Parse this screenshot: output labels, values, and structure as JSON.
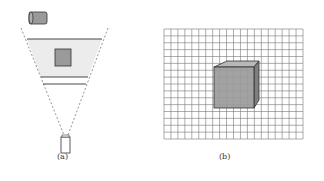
{
  "panels": [
    {
      "id": "a",
      "caption": "(a)",
      "description": "Top-down view: tilted projector/camera above, a shaded viewing frustum containing a square object between two horizontal planes, and a camera at the bottom apex",
      "elements": [
        "projector-top",
        "frustum-shaded-region",
        "object-square",
        "near-plane-lines",
        "camera-bottom",
        "dashed-frustum-edges"
      ]
    },
    {
      "id": "b",
      "caption": "(b)",
      "description": "Cube shown in perspective against a uniform square grid background",
      "grid": {
        "columns": 20,
        "rows": 16
      },
      "elements": [
        "grid-background",
        "cube"
      ]
    }
  ],
  "colors": {
    "object_fill": "#9a9a9a",
    "frustum_fill": "#ececec",
    "stroke": "#333333",
    "grid_line": "#777777",
    "dash": "#888888"
  }
}
